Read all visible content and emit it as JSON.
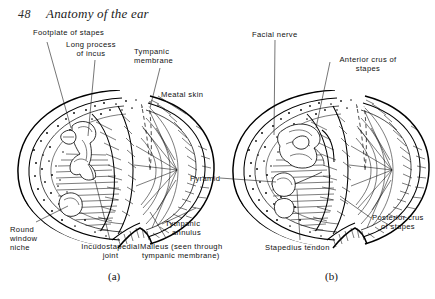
{
  "page": {
    "folio": "48",
    "running_title": "Anatomy of the ear",
    "background_color": "#ffffff",
    "ink_color": "#0d0d0d"
  },
  "figure_a": {
    "caption": "(a)",
    "labels": {
      "footplate_of_stapes": "Footplate of stapes",
      "long_process_of_incus_1": "Long process",
      "long_process_of_incus_2": "of incus",
      "tympanic_membrane_1": "Tympanic",
      "tympanic_membrane_2": "membrane",
      "meatal_skin": "Meatal skin",
      "round_window_niche_1": "Round",
      "round_window_niche_2": "window",
      "round_window_niche_3": "niche",
      "incudostapedial_joint_1": "Incudostapedial",
      "incudostapedial_joint_2": "joint",
      "tympanic_annulus_1": "Tympanic",
      "tympanic_annulus_2": "annulus",
      "malleus_1": "Malleus (seen through",
      "malleus_2": "tympanic membrane)"
    }
  },
  "figure_b": {
    "caption": "(b)",
    "labels": {
      "facial_nerve": "Facial nerve",
      "anterior_crus_of_stapes_1": "Anterior crus of",
      "anterior_crus_of_stapes_2": "stapes",
      "pyramid": "Pyramid",
      "posterior_crus_of_stapes_1": "Posterior crus",
      "posterior_crus_of_stapes_2": "of stapes",
      "stapedius_tendon": "Stapedius tendon"
    }
  }
}
